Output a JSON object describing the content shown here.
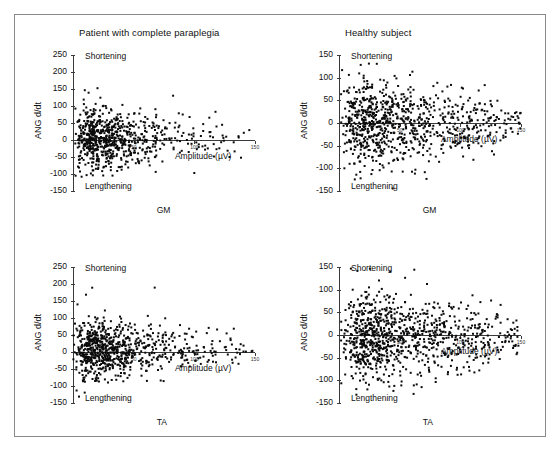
{
  "figure": {
    "background": "#ffffff",
    "border_color": "#8a8a8a",
    "point_color": "#0b0b0b",
    "axis_color": "#3a3a3a"
  },
  "columns": [
    {
      "id": "patient",
      "title": "Patient with complete paraplegia"
    },
    {
      "id": "healthy",
      "title": "Healthy subject"
    }
  ],
  "labels": {
    "shortening": "Shortening",
    "lengthening": "Lengthening",
    "amplitude": "Amplitude (µV)",
    "ylabel": "ANG d/dt",
    "muscle_gm": "GM",
    "muscle_ta": "TA"
  },
  "chart_data": [
    {
      "id": "patient-gm",
      "type": "scatter",
      "title": "Patient with complete paraplegia",
      "subject": "Patient with complete paraplegia",
      "muscle": "GM",
      "xlabel": "Amplitude (µV)",
      "ylabel": "ANG d/dt",
      "ylim": [
        -150,
        250
      ],
      "yticks": [
        250,
        200,
        150,
        100,
        50,
        0,
        -50,
        -100,
        -150
      ],
      "xlim": [
        0,
        150
      ],
      "xticks": [
        0,
        50,
        100,
        150
      ],
      "xticklabels": [
        "0",
        "50",
        "100",
        "150"
      ],
      "grid": false,
      "legend": null,
      "annotations": [
        {
          "text": "Shortening",
          "position": "top-left"
        },
        {
          "text": "Lengthening",
          "position": "bottom-left"
        }
      ],
      "n_points": 760,
      "point_marker": "square",
      "point_size_px": 2,
      "density": {
        "x_mode": 14,
        "x_decay": 30,
        "y_center": 2,
        "y_spread": 36,
        "y_spread_decay": 0.55
      },
      "seed": 1701
    },
    {
      "id": "healthy-gm",
      "type": "scatter",
      "title": "Healthy subject",
      "subject": "Healthy subject",
      "muscle": "GM",
      "xlabel": "Amplitude (µV)",
      "ylabel": "ANG d/dt",
      "ylim": [
        -150,
        150
      ],
      "yticks": [
        150,
        100,
        50,
        0,
        -50,
        -100,
        -150
      ],
      "xlim": [
        0,
        150
      ],
      "xticks": [
        0,
        50,
        100,
        150
      ],
      "xticklabels": [
        "0",
        "50",
        "100",
        "150"
      ],
      "grid": false,
      "legend": null,
      "annotations": [
        {
          "text": "Shortening",
          "position": "top-left"
        },
        {
          "text": "Lengthening",
          "position": "bottom-left"
        }
      ],
      "n_points": 900,
      "point_marker": "square",
      "point_size_px": 2,
      "density": {
        "x_mode": 20,
        "x_decay": 46,
        "y_center": 0,
        "y_spread": 40,
        "y_spread_decay": 0.5
      },
      "seed": 2203
    },
    {
      "id": "patient-ta",
      "type": "scatter",
      "title": "Patient with complete paraplegia",
      "subject": "Patient with complete paraplegia",
      "muscle": "TA",
      "xlabel": "Amplitude (µV)",
      "ylabel": "ANG d/dt",
      "ylim": [
        -150,
        250
      ],
      "yticks": [
        250,
        200,
        150,
        100,
        50,
        0,
        -50,
        -100,
        -150
      ],
      "xlim": [
        0,
        150
      ],
      "xticks": [
        0,
        50,
        100,
        150
      ],
      "xticklabels": [
        "0",
        "50",
        "100",
        "150"
      ],
      "grid": false,
      "legend": null,
      "annotations": [
        {
          "text": "Shortening",
          "position": "top-left"
        },
        {
          "text": "Lengthening",
          "position": "bottom-left"
        }
      ],
      "n_points": 820,
      "point_marker": "square",
      "point_size_px": 2,
      "density": {
        "x_mode": 16,
        "x_decay": 32,
        "y_center": 4,
        "y_spread": 34,
        "y_spread_decay": 0.55
      },
      "seed": 3307
    },
    {
      "id": "healthy-ta",
      "type": "scatter",
      "title": "Healthy subject",
      "subject": "Healthy subject",
      "muscle": "TA",
      "xlabel": "Amplitude (µV)",
      "ylabel": "ANG d/dt",
      "ylim": [
        -150,
        150
      ],
      "yticks": [
        150,
        100,
        50,
        0,
        -50,
        -100,
        -150
      ],
      "xlim": [
        0,
        150
      ],
      "xticks": [
        0,
        50,
        100,
        150
      ],
      "xticklabels": [
        "0",
        "50",
        "100",
        "150"
      ],
      "grid": false,
      "legend": null,
      "annotations": [
        {
          "text": "Shortening",
          "position": "top-left"
        },
        {
          "text": "Lengthening",
          "position": "bottom-left"
        }
      ],
      "n_points": 980,
      "point_marker": "square",
      "point_size_px": 2,
      "density": {
        "x_mode": 22,
        "x_decay": 50,
        "y_center": -4,
        "y_spread": 38,
        "y_spread_decay": 0.45
      },
      "seed": 4409
    }
  ]
}
